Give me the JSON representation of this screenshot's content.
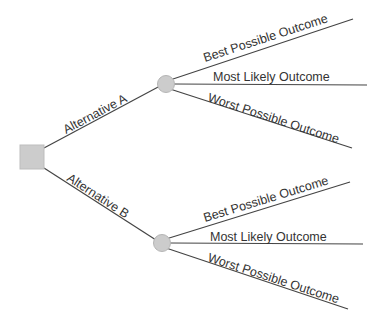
{
  "diagram": {
    "type": "decision-tree",
    "colors": {
      "node_fill": "#cccccc",
      "node_stroke": "#b5b5b5",
      "edge": "#444444",
      "text": "#333333"
    },
    "decision_node": {
      "shape": "square"
    },
    "alternatives": [
      {
        "label": "Alternative A",
        "outcomes": [
          {
            "label": "Best Possible Outcome"
          },
          {
            "label": "Most Likely Outcome"
          },
          {
            "label": "Worst Possible Outcome"
          }
        ]
      },
      {
        "label": "Alternative B",
        "outcomes": [
          {
            "label": "Best Possible Outcome"
          },
          {
            "label": "Most Likely Outcome"
          },
          {
            "label": "Worst Possible Outcome"
          }
        ]
      }
    ]
  }
}
